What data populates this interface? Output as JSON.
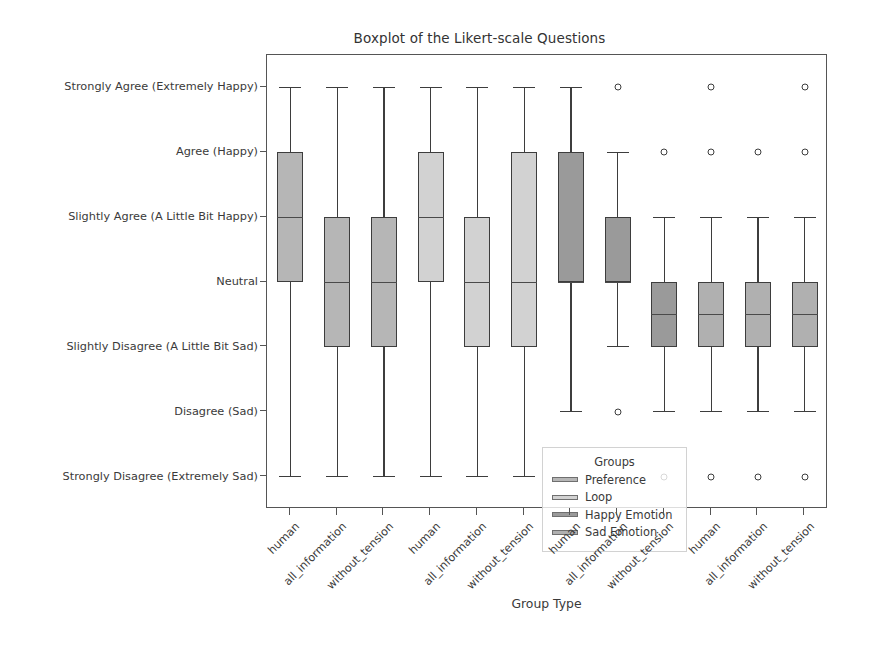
{
  "chart_data": {
    "type": "box",
    "title": "Boxplot of the Likert-scale Questions",
    "xlabel": "Group Type",
    "ylabel": "",
    "grid": false,
    "legend_position": "lower left (inside axes)",
    "legend_title": "Groups",
    "ytick_labels": [
      "Strongly Agree (Extremely Happy)",
      "Agree (Happy)",
      "Slightly Agree (A Little Bit Happy)",
      "Neutral",
      "Slightly Disagree (A Little Bit Sad)",
      "Disagree (Sad)",
      "Strongly Disagree (Extremely Sad)"
    ],
    "ytick_values": [
      3,
      2,
      1,
      0,
      -1,
      -2,
      -3
    ],
    "ylim": [
      -3.5,
      3.5
    ],
    "xtick_labels": [
      "human",
      "all_information",
      "without_tension",
      "human",
      "all_information",
      "without_tension",
      "human",
      "all_information",
      "without_tension",
      "human",
      "all_information",
      "without_tension"
    ],
    "groups": [
      {
        "name": "Preference",
        "color": "#b6b6b6"
      },
      {
        "name": "Loop",
        "color": "#d2d2d2"
      },
      {
        "name": "Happy Emotion",
        "color": "#9a9a9a"
      },
      {
        "name": "Sad Emotion",
        "color": "#b0b0b0"
      }
    ],
    "boxes": [
      {
        "x_label": "human",
        "group": "Preference",
        "whislo": -3.0,
        "q1": 0.0,
        "med": 1.0,
        "q3": 2.0,
        "whishi": 3.0,
        "fliers": []
      },
      {
        "x_label": "all_information",
        "group": "Preference",
        "whislo": -3.0,
        "q1": -1.0,
        "med": 0.0,
        "q3": 1.0,
        "whishi": 3.0,
        "fliers": []
      },
      {
        "x_label": "without_tension",
        "group": "Preference",
        "whislo": -3.0,
        "q1": -1.0,
        "med": 0.0,
        "q3": 1.0,
        "whishi": 3.0,
        "fliers": []
      },
      {
        "x_label": "human",
        "group": "Loop",
        "whislo": -3.0,
        "q1": 0.0,
        "med": 1.0,
        "q3": 2.0,
        "whishi": 3.0,
        "fliers": []
      },
      {
        "x_label": "all_information",
        "group": "Loop",
        "whislo": -3.0,
        "q1": -1.0,
        "med": 0.0,
        "q3": 1.0,
        "whishi": 3.0,
        "fliers": []
      },
      {
        "x_label": "without_tension",
        "group": "Loop",
        "whislo": -3.0,
        "q1": -1.0,
        "med": 0.0,
        "q3": 2.0,
        "whishi": 3.0,
        "fliers": []
      },
      {
        "x_label": "human",
        "group": "Happy Emotion",
        "whislo": -2.0,
        "q1": 0.0,
        "med": 0.0,
        "q3": 2.0,
        "whishi": 3.0,
        "fliers": []
      },
      {
        "x_label": "all_information",
        "group": "Happy Emotion",
        "whislo": -1.0,
        "q1": 0.0,
        "med": 0.0,
        "q3": 1.0,
        "whishi": 2.0,
        "fliers": [
          3.0,
          -2.0
        ]
      },
      {
        "x_label": "without_tension",
        "group": "Happy Emotion",
        "whislo": -2.0,
        "q1": -1.0,
        "med": -0.5,
        "q3": 0.0,
        "whishi": 1.0,
        "fliers": [
          2.0,
          -3.0
        ]
      },
      {
        "x_label": "human",
        "group": "Sad Emotion",
        "whislo": -2.0,
        "q1": -1.0,
        "med": -0.5,
        "q3": 0.0,
        "whishi": 1.0,
        "fliers": [
          3.0,
          2.0,
          -3.0
        ]
      },
      {
        "x_label": "all_information",
        "group": "Sad Emotion",
        "whislo": -2.0,
        "q1": -1.0,
        "med": -0.5,
        "q3": 0.0,
        "whishi": 1.0,
        "fliers": [
          2.0,
          -3.0
        ]
      },
      {
        "x_label": "without_tension",
        "group": "Sad Emotion",
        "whislo": -2.0,
        "q1": -1.0,
        "med": -0.5,
        "q3": 0.0,
        "whishi": 1.0,
        "fliers": [
          3.0,
          2.0,
          -3.0
        ]
      }
    ]
  },
  "legend": {
    "title": "Groups",
    "entries": [
      {
        "label": "Preference",
        "color": "#b6b6b6"
      },
      {
        "label": "Loop",
        "color": "#d2d2d2"
      },
      {
        "label": "Happy Emotion",
        "color": "#9a9a9a"
      },
      {
        "label": "Sad Emotion",
        "color": "#b0b0b0"
      }
    ]
  }
}
